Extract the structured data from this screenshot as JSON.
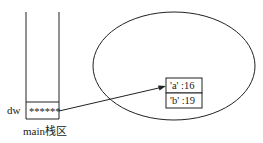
{
  "stack": {
    "label": "main栈区",
    "variable_name": "dw",
    "variable_value": "******"
  },
  "heap": {
    "dict_entries": [
      {
        "text": "'a' :16"
      },
      {
        "text": "'b' :19"
      }
    ]
  },
  "colors": {
    "stroke": "#222222",
    "background": "#ffffff"
  }
}
